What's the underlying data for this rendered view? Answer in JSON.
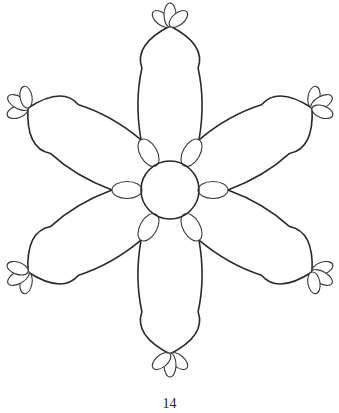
{
  "page": {
    "number": "14"
  },
  "drawing": {
    "subject": "six-petal flower line art",
    "petal_count": 6,
    "inner_oval_count": 6,
    "tip_leaflets_per_petal": 3,
    "stroke_color": "#2a2a2a",
    "background_color": "#ffffff"
  }
}
